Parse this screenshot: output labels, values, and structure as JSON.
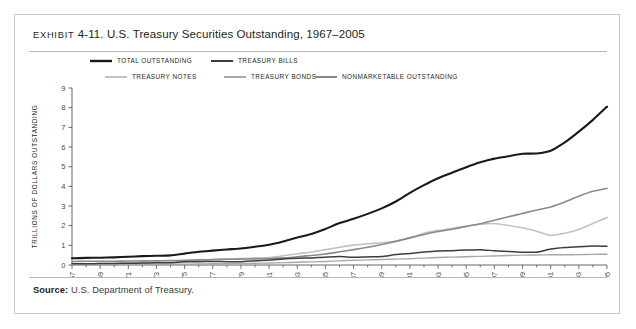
{
  "exhibit": {
    "label": "Exhibit",
    "number": "4-11.",
    "title": "U.S. Treasury Securities Outstanding, 1967–2005"
  },
  "source": {
    "prefix": "Source:",
    "text": " U.S. Department of Treasury."
  },
  "chart_data": {
    "type": "line",
    "title": "U.S. Treasury Securities Outstanding, 1967–2005",
    "xlabel": "YEAR",
    "ylabel": "TRILLIONS OF DOLLARS OUTSTANDING",
    "xlim": [
      1967,
      2005
    ],
    "ylim": [
      0,
      9
    ],
    "yticks": [
      0,
      1,
      2,
      3,
      4,
      5,
      6,
      7,
      8,
      9
    ],
    "grid": false,
    "legend_position": "top-left",
    "x": [
      1967,
      1968,
      1969,
      1970,
      1971,
      1972,
      1973,
      1974,
      1975,
      1976,
      1977,
      1978,
      1979,
      1980,
      1981,
      1982,
      1983,
      1984,
      1985,
      1986,
      1987,
      1988,
      1989,
      1990,
      1991,
      1992,
      1993,
      1994,
      1995,
      1996,
      1997,
      1998,
      1999,
      2000,
      2001,
      2002,
      2003,
      2004,
      2005
    ],
    "series": [
      {
        "name": "TOTAL OUTSTANDING",
        "color": "#1a1a1a",
        "width": 2.1,
        "values": [
          0.34,
          0.36,
          0.37,
          0.39,
          0.42,
          0.45,
          0.47,
          0.49,
          0.58,
          0.67,
          0.73,
          0.79,
          0.84,
          0.93,
          1.03,
          1.2,
          1.4,
          1.58,
          1.83,
          2.13,
          2.35,
          2.6,
          2.88,
          3.23,
          3.67,
          4.06,
          4.41,
          4.69,
          4.97,
          5.22,
          5.41,
          5.53,
          5.66,
          5.67,
          5.81,
          6.23,
          6.78,
          7.38,
          8.05
        ]
      },
      {
        "name": "TREASURY BILLS",
        "color": "#3d3d3d",
        "width": 1.5,
        "values": [
          0.06,
          0.06,
          0.07,
          0.08,
          0.09,
          0.1,
          0.11,
          0.12,
          0.16,
          0.17,
          0.18,
          0.17,
          0.17,
          0.22,
          0.25,
          0.31,
          0.34,
          0.36,
          0.4,
          0.43,
          0.39,
          0.41,
          0.43,
          0.53,
          0.59,
          0.66,
          0.71,
          0.73,
          0.76,
          0.78,
          0.72,
          0.69,
          0.65,
          0.65,
          0.81,
          0.89,
          0.93,
          0.96,
          0.95
        ]
      },
      {
        "name": "TREASURY NOTES",
        "color": "#c2c2c2",
        "width": 1.6,
        "values": [
          0.05,
          0.06,
          0.07,
          0.08,
          0.1,
          0.12,
          0.13,
          0.13,
          0.17,
          0.22,
          0.27,
          0.31,
          0.33,
          0.36,
          0.38,
          0.47,
          0.57,
          0.66,
          0.78,
          0.9,
          1.01,
          1.08,
          1.13,
          1.22,
          1.39,
          1.61,
          1.76,
          1.87,
          1.98,
          2.07,
          2.11,
          2.01,
          1.89,
          1.72,
          1.51,
          1.61,
          1.8,
          2.11,
          2.42
        ]
      },
      {
        "name": "TREASURY BONDS",
        "color": "#a8a8a8",
        "width": 1.4,
        "values": [
          0.04,
          0.04,
          0.04,
          0.04,
          0.04,
          0.04,
          0.04,
          0.04,
          0.04,
          0.05,
          0.06,
          0.07,
          0.08,
          0.09,
          0.1,
          0.12,
          0.14,
          0.16,
          0.18,
          0.21,
          0.24,
          0.26,
          0.28,
          0.3,
          0.32,
          0.35,
          0.38,
          0.4,
          0.42,
          0.44,
          0.46,
          0.48,
          0.5,
          0.51,
          0.52,
          0.52,
          0.53,
          0.54,
          0.55
        ]
      },
      {
        "name": "NONMARKETABLE OUTSTANDING",
        "color": "#8a8a8a",
        "width": 1.6,
        "values": [
          0.18,
          0.19,
          0.19,
          0.19,
          0.2,
          0.21,
          0.21,
          0.22,
          0.24,
          0.26,
          0.28,
          0.29,
          0.3,
          0.31,
          0.33,
          0.36,
          0.42,
          0.48,
          0.56,
          0.67,
          0.78,
          0.9,
          1.04,
          1.2,
          1.38,
          1.55,
          1.7,
          1.82,
          1.96,
          2.1,
          2.28,
          2.45,
          2.62,
          2.8,
          2.95,
          3.2,
          3.5,
          3.75,
          3.9
        ]
      }
    ],
    "xtick_labels": [
      "1967",
      "1969",
      "1971",
      "1973",
      "1975",
      "1977",
      "1979",
      "1981",
      "1983",
      "1985",
      "1987",
      "1989",
      "1991",
      "1993",
      "1995",
      "1997",
      "1999",
      "2001",
      "2003",
      "2005"
    ],
    "legend": [
      {
        "name": "TOTAL OUTSTANDING",
        "color": "#1a1a1a",
        "width": 2.4,
        "row": 0,
        "col": 0
      },
      {
        "name": "TREASURY BILLS",
        "color": "#3d3d3d",
        "width": 2.0,
        "row": 0,
        "col": 1
      },
      {
        "name": "TREASURY NOTES",
        "color": "#c2c2c2",
        "width": 2.0,
        "row": 1,
        "col": 0
      },
      {
        "name": "TREASURY BONDS",
        "color": "#a8a8a8",
        "width": 2.0,
        "row": 1,
        "col": 1
      },
      {
        "name": "NONMARKETABLE OUTSTANDING",
        "color": "#8a8a8a",
        "width": 2.0,
        "row": 1,
        "col": 2
      }
    ]
  }
}
